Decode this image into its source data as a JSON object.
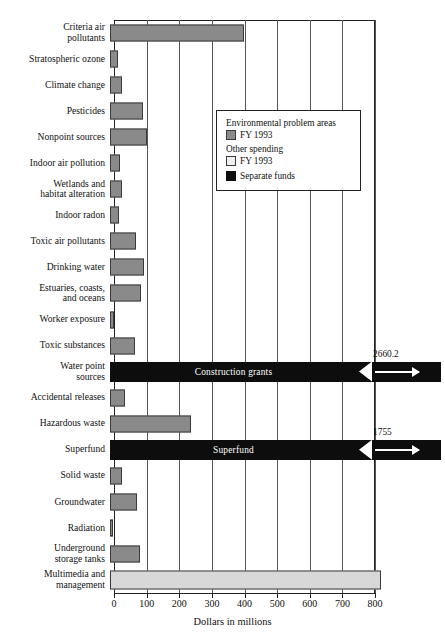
{
  "chart_data": {
    "type": "bar",
    "orientation": "horizontal",
    "title": "",
    "xlabel": "Dollars in millions",
    "ylabel": "",
    "xlim": [
      0,
      800
    ],
    "xticks": [
      0,
      100,
      200,
      300,
      400,
      500,
      600,
      700,
      800
    ],
    "grid": true,
    "categories": [
      "Criteria air pollutants",
      "Stratospheric ozone",
      "Climate change",
      "Pesticides",
      "Nonpoint sources",
      "Indoor air pollution",
      "Wetlands and habitat alteration",
      "Indoor radon",
      "Toxic air pollutants",
      "Drinking water",
      "Estuaries, coasts, and oceans",
      "Worker exposure",
      "Toxic substances",
      "Water point sources",
      "Accidental releases",
      "Hazardous waste",
      "Superfund",
      "Solid waste",
      "Groundwater",
      "Radiation",
      "Underground storage tanks",
      "Multimedia and management"
    ],
    "values": [
      410,
      26,
      37,
      100,
      113,
      30,
      38,
      28,
      80,
      103,
      95,
      12,
      78,
      2660.2,
      45,
      248,
      1755,
      38,
      83,
      9,
      93,
      830
    ],
    "series": [
      {
        "name": "Environmental problem areas FY 1993",
        "color": "#8a8a8a",
        "values": [
          410,
          26,
          37,
          100,
          113,
          30,
          38,
          28,
          80,
          103,
          95,
          12,
          78,
          null,
          45,
          248,
          null,
          38,
          83,
          9,
          93,
          null
        ]
      },
      {
        "name": "Other spending FY 1993",
        "color": "#d8d8d8",
        "values": [
          null,
          null,
          null,
          null,
          null,
          null,
          null,
          null,
          null,
          null,
          null,
          null,
          null,
          null,
          null,
          null,
          null,
          null,
          null,
          null,
          null,
          830
        ]
      },
      {
        "name": "Separate funds",
        "color": "#0d0d0d",
        "values": [
          null,
          null,
          null,
          null,
          null,
          null,
          null,
          null,
          null,
          null,
          null,
          null,
          null,
          2660.2,
          null,
          null,
          1755,
          null,
          null,
          null,
          null,
          null
        ]
      }
    ],
    "annotations": [
      {
        "category": "Water point sources",
        "inline_label": "Construction grants",
        "value_label": "2660.2",
        "broken_axis": true
      },
      {
        "category": "Superfund",
        "inline_label": "Superfund",
        "value_label": "1755",
        "broken_axis": true
      }
    ]
  },
  "rows": [
    {
      "l1": "Criteria air",
      "l2": "pollutants",
      "value": 410,
      "kind": "problem"
    },
    {
      "l1": "Stratospheric ozone",
      "l2": "",
      "value": 26,
      "kind": "problem"
    },
    {
      "l1": "Climate change",
      "l2": "",
      "value": 37,
      "kind": "problem"
    },
    {
      "l1": "Pesticides",
      "l2": "",
      "value": 100,
      "kind": "problem"
    },
    {
      "l1": "Nonpoint sources",
      "l2": "",
      "value": 113,
      "kind": "problem"
    },
    {
      "l1": "Indoor air pollution",
      "l2": "",
      "value": 30,
      "kind": "problem"
    },
    {
      "l1": "Wetlands and",
      "l2": "habitat alteration",
      "value": 38,
      "kind": "problem"
    },
    {
      "l1": "Indoor radon",
      "l2": "",
      "value": 28,
      "kind": "problem"
    },
    {
      "l1": "Toxic air pollutants",
      "l2": "",
      "value": 80,
      "kind": "problem"
    },
    {
      "l1": "Drinking water",
      "l2": "",
      "value": 103,
      "kind": "problem"
    },
    {
      "l1": "Estuaries, coasts,",
      "l2": "and oceans",
      "value": 95,
      "kind": "problem"
    },
    {
      "l1": "Worker exposure",
      "l2": "",
      "value": 12,
      "kind": "problem"
    },
    {
      "l1": "Toxic substances",
      "l2": "",
      "value": 78,
      "kind": "problem"
    },
    {
      "l1": "Water point",
      "l2": "sources",
      "value": 2660.2,
      "kind": "separate",
      "inline": "Construction grants",
      "tag": "2660.2"
    },
    {
      "l1": "Accidental releases",
      "l2": "",
      "value": 45,
      "kind": "problem"
    },
    {
      "l1": "Hazardous waste",
      "l2": "",
      "value": 248,
      "kind": "problem"
    },
    {
      "l1": "Superfund",
      "l2": "",
      "value": 1755,
      "kind": "separate",
      "inline": "Superfund",
      "tag": "1755"
    },
    {
      "l1": "Solid waste",
      "l2": "",
      "value": 38,
      "kind": "problem"
    },
    {
      "l1": "Groundwater",
      "l2": "",
      "value": 83,
      "kind": "problem"
    },
    {
      "l1": "Radiation",
      "l2": "",
      "value": 9,
      "kind": "problem"
    },
    {
      "l1": "Underground",
      "l2": "storage tanks",
      "value": 93,
      "kind": "problem"
    },
    {
      "l1": "Multimedia and",
      "l2": "management",
      "value": 830,
      "kind": "other"
    }
  ],
  "legend": {
    "title1": "Environmental problem areas",
    "item1": "FY 1993",
    "title2": "Other spending",
    "item2": "FY 1993",
    "item3": "Separate funds"
  },
  "axis": {
    "title": "Dollars in millions",
    "ticks": [
      "0",
      "100",
      "200",
      "300",
      "400",
      "500",
      "600",
      "700",
      "800"
    ]
  },
  "colors": {
    "problem": "#8a8a8a",
    "other": "#d8d8d8",
    "separate": "#0d0d0d",
    "outline": "#3a3a3a"
  }
}
